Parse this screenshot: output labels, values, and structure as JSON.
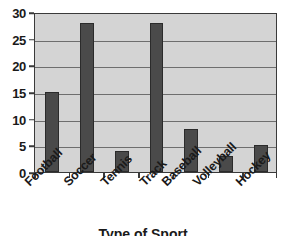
{
  "chart_data": {
    "type": "bar",
    "title": "",
    "subtitle": "",
    "xlabel": "Type of Sport",
    "ylabel": "",
    "categories": [
      "Football",
      "Soccer",
      "Tennis",
      "Track",
      "Baseball",
      "Volleyball",
      "Hockey"
    ],
    "values": [
      15,
      28,
      4,
      28,
      8,
      3,
      5
    ],
    "series": [
      {
        "name": "",
        "values": [
          15,
          28,
          4,
          28,
          8,
          3,
          5
        ]
      }
    ],
    "ylim": [
      0,
      30
    ],
    "y_ticks": [
      0,
      5,
      10,
      15,
      20,
      25,
      30
    ],
    "y_tick_labels": [
      "0",
      "5",
      "10",
      "15",
      "20",
      "25",
      "30"
    ],
    "grid": true,
    "grid_orientation": "horizontal",
    "legend": false,
    "legend_position": "none",
    "x_tick_label_rotation": -45,
    "annotations": [],
    "colors": {
      "bar_fill": "#4a4a4a",
      "bar_border": "#2b2b2b",
      "plot_background": "#d4d4d4",
      "plot_border": "#3a3a3a",
      "gridline": "#6e6e6e",
      "text": "#1a1a1a",
      "figure_background": "#ffffff"
    }
  },
  "axis_title_note": "x-axis title is cropped by the bottom edge of the screenshot"
}
